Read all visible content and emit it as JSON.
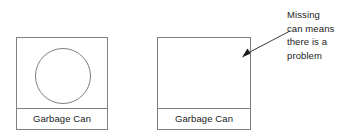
{
  "diagram": {
    "title_text": "",
    "line_color": "#808080",
    "text_color": "#1a1a1a",
    "background": "#ffffff",
    "boxes": [
      {
        "id": "garbage-can-present",
        "label": "Garbage Can",
        "contents_icon": "circle-can-shape",
        "has_can": true
      },
      {
        "id": "garbage-can-missing",
        "label": "Garbage Can",
        "contents_icon": "",
        "has_can": false
      }
    ],
    "annotation": {
      "lines": [
        "Missing",
        "can means",
        "there is a",
        "problem"
      ],
      "arrow": {
        "icon": "arrow-pointing-left-down",
        "from_x": 290,
        "from_y": 31,
        "to_x": 242,
        "to_y": 57
      }
    }
  }
}
